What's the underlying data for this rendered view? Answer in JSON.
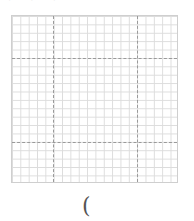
{
  "header": {
    "faint_marks": "· · ·"
  },
  "grid": {
    "columns": 20,
    "rows": 20,
    "major_divisions": 3
  },
  "footer": {
    "bracket_text": "("
  }
}
